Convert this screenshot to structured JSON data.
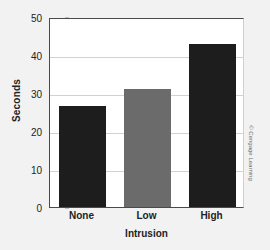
{
  "chart_data": {
    "type": "bar",
    "title": "",
    "categories": [
      "None",
      "Low",
      "High"
    ],
    "values": [
      26.5,
      31,
      43
    ],
    "series": [
      {
        "name": "Seconds",
        "values": [
          26.5,
          31,
          43
        ]
      }
    ],
    "xlabel": "Intrusion",
    "ylabel": "Seconds",
    "ylim": [
      0,
      50
    ],
    "yticks": [
      0,
      10,
      20,
      30,
      40,
      50
    ],
    "ytick_labels": [
      "0",
      "10",
      "20",
      "30",
      "40",
      "50"
    ],
    "grid": true,
    "legend": false,
    "bar_colors": [
      "#1d1d1d",
      "#6b6b6b",
      "#1d1d1d"
    ],
    "plot_background": "#ffffff",
    "figure_background": "#f2f2f2",
    "gridline_color": "#d2d2d2",
    "axis_color": "#4a4a4a"
  },
  "credit": "© Cengage Learning"
}
